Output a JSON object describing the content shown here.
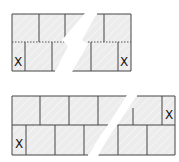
{
  "diagrams": [
    {
      "name": "stretcher-bond-top",
      "rows": 2,
      "course_separator": "dotted",
      "marks": [
        {
          "label": "X",
          "row": 2,
          "position": "left-end"
        },
        {
          "label": "X",
          "row": 2,
          "position": "right-end"
        }
      ]
    },
    {
      "name": "stretcher-bond-bottom",
      "rows": 2,
      "course_separator": "solid",
      "marks": [
        {
          "label": "X",
          "row": 1,
          "position": "right-end"
        },
        {
          "label": "X",
          "row": 2,
          "position": "left-end"
        }
      ]
    }
  ],
  "labels": {
    "top_left_x": "X",
    "top_right_x": "X",
    "bottom_right_x": "X",
    "bottom_left_x": "X"
  },
  "colors": {
    "fill": "#ececec",
    "stroke": "#444444",
    "background": "#ffffff"
  }
}
